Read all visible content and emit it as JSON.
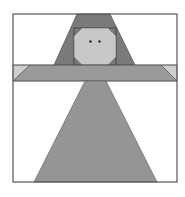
{
  "figure": {
    "title": "",
    "colors": {
      "background": "#ffffff",
      "frame": "#555555",
      "hair": "#7a7a7a",
      "face": "#c8c8c8",
      "face_outline": "#444444",
      "eyes": "#222222",
      "arm_band": "#9a9a9a",
      "arm_corner_light": "#cfcfcf",
      "dress": "#959595",
      "seam": "#5a5a5a"
    },
    "pieces": [
      {
        "name": "hair",
        "shape": "trapezoid"
      },
      {
        "name": "face",
        "shape": "octagon"
      },
      {
        "name": "left-eye",
        "shape": "dot"
      },
      {
        "name": "right-eye",
        "shape": "dot"
      },
      {
        "name": "arm-band",
        "shape": "trapezoid"
      },
      {
        "name": "left-arm-corner",
        "shape": "triangle"
      },
      {
        "name": "right-arm-corner",
        "shape": "triangle"
      },
      {
        "name": "dress",
        "shape": "trapezoid"
      }
    ]
  }
}
